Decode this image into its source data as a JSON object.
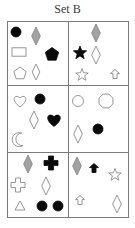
{
  "title": "Set B",
  "colors": {
    "border": "#7a7a7a",
    "black": "#0a0a0a",
    "gray_fill": "#a3a3a3",
    "gray_stroke": "#7d7d7d",
    "outline": "#8a8a8a",
    "background": "#ffffff"
  },
  "grid": {
    "rows": 3,
    "cols": 2,
    "x": [
      7,
      68,
      128
    ],
    "y": [
      21,
      85,
      152,
      217
    ]
  },
  "cells": [
    {
      "position": "row1-col1",
      "shapes": [
        {
          "type": "circle",
          "fill": "black",
          "x": 16,
          "y": 32,
          "size": 10
        },
        {
          "type": "diamond",
          "fill": "gray",
          "x": 36,
          "y": 36,
          "size": 18
        },
        {
          "type": "rectangle",
          "fill": "white",
          "x": 19,
          "y": 52,
          "size": 14
        },
        {
          "type": "pentagon",
          "fill": "black",
          "x": 52,
          "y": 54,
          "size": 14
        },
        {
          "type": "pentagon",
          "fill": "white",
          "x": 20,
          "y": 73,
          "size": 13
        },
        {
          "type": "diamond",
          "fill": "white",
          "x": 36,
          "y": 72,
          "size": 16
        }
      ]
    },
    {
      "position": "row1-col2",
      "shapes": [
        {
          "type": "diamond",
          "fill": "gray",
          "x": 96,
          "y": 33,
          "size": 18
        },
        {
          "type": "star",
          "fill": "black",
          "x": 80,
          "y": 52,
          "size": 14
        },
        {
          "type": "diamond",
          "fill": "white",
          "x": 96,
          "y": 55,
          "size": 18
        },
        {
          "type": "star",
          "fill": "white",
          "x": 82,
          "y": 74,
          "size": 13
        },
        {
          "type": "arrow-up",
          "fill": "white",
          "x": 115,
          "y": 74,
          "size": 9
        }
      ]
    },
    {
      "position": "row2-col1",
      "shapes": [
        {
          "type": "heart",
          "fill": "white",
          "x": 20,
          "y": 101,
          "size": 14
        },
        {
          "type": "circle",
          "fill": "black",
          "x": 40,
          "y": 99,
          "size": 10
        },
        {
          "type": "diamond",
          "fill": "white",
          "x": 34,
          "y": 120,
          "size": 18
        },
        {
          "type": "heart",
          "fill": "black",
          "x": 54,
          "y": 120,
          "size": 15
        },
        {
          "type": "crescent",
          "fill": "white",
          "x": 18,
          "y": 140,
          "size": 14
        }
      ]
    },
    {
      "position": "row2-col2",
      "shapes": [
        {
          "type": "circle",
          "fill": "white",
          "x": 78,
          "y": 101,
          "size": 11
        },
        {
          "type": "octagon",
          "fill": "white",
          "x": 106,
          "y": 101,
          "size": 15
        },
        {
          "type": "diamond",
          "fill": "white",
          "x": 78,
          "y": 134,
          "size": 18
        },
        {
          "type": "circle",
          "fill": "black",
          "x": 98,
          "y": 129,
          "size": 10
        }
      ]
    },
    {
      "position": "row3-col1",
      "shapes": [
        {
          "type": "diamond",
          "fill": "gray",
          "x": 28,
          "y": 164,
          "size": 18
        },
        {
          "type": "cross",
          "fill": "black",
          "x": 51,
          "y": 163,
          "size": 14
        },
        {
          "type": "cross",
          "fill": "white",
          "x": 18,
          "y": 185,
          "size": 14
        },
        {
          "type": "diamond",
          "fill": "white",
          "x": 46,
          "y": 186,
          "size": 18
        },
        {
          "type": "triangle",
          "fill": "white",
          "x": 20,
          "y": 206,
          "size": 10
        },
        {
          "type": "circle",
          "fill": "black",
          "x": 42,
          "y": 206,
          "size": 10
        },
        {
          "type": "circle",
          "fill": "black",
          "x": 58,
          "y": 206,
          "size": 10
        }
      ]
    },
    {
      "position": "row3-col2",
      "shapes": [
        {
          "type": "diamond",
          "fill": "gray",
          "x": 77,
          "y": 166,
          "size": 18
        },
        {
          "type": "arrow-up",
          "fill": "black",
          "x": 94,
          "y": 168,
          "size": 9
        },
        {
          "type": "star",
          "fill": "white",
          "x": 115,
          "y": 174,
          "size": 13
        },
        {
          "type": "arrow-up",
          "fill": "white",
          "x": 80,
          "y": 200,
          "size": 9
        },
        {
          "type": "diamond",
          "fill": "white",
          "x": 117,
          "y": 204,
          "size": 18
        }
      ]
    }
  ]
}
